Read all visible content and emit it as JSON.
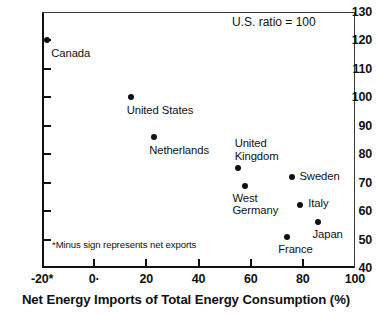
{
  "chart_data": {
    "type": "scatter",
    "title": "",
    "xlabel": "Net Energy Imports of Total Energy Consumption (%)",
    "ylabel": "",
    "xlim": [
      -20,
      100
    ],
    "ylim": [
      40,
      130
    ],
    "grid": false,
    "legend": "none",
    "annotation": "U.S. ratio = 100",
    "footnote": "*Minus sign represents net exports",
    "x_ticks": [
      "-20*",
      "0·",
      "20",
      "40",
      "60",
      "80",
      "100"
    ],
    "x_tick_values": [
      -20,
      0,
      20,
      40,
      60,
      80,
      100
    ],
    "y_ticks": [
      "40",
      "50",
      "60",
      "70",
      "80",
      "90",
      "100",
      "110",
      "120",
      "130"
    ],
    "y_tick_values": [
      40,
      50,
      60,
      70,
      80,
      90,
      100,
      110,
      120,
      130
    ],
    "points": [
      {
        "label": "Canada",
        "x": -18,
        "y": 120,
        "label_lines": [
          "Canada"
        ],
        "label_dx": 4,
        "label_dy": 7,
        "label_align": "left"
      },
      {
        "label": "United States",
        "x": 14,
        "y": 100,
        "label_lines": [
          "United States"
        ],
        "label_dx": -4,
        "label_dy": 7,
        "label_align": "left"
      },
      {
        "label": "Netherlands",
        "x": 23,
        "y": 86,
        "label_lines": [
          "Netherlands"
        ],
        "label_dx": -5,
        "label_dy": 7,
        "label_align": "left"
      },
      {
        "label": "United Kingdom",
        "x": 55,
        "y": 75,
        "label_lines": [
          "United",
          "Kingdom"
        ],
        "label_dx": -3,
        "label_dy": -31,
        "label_align": "left"
      },
      {
        "label": "West Germany",
        "x": 58,
        "y": 69,
        "label_lines": [
          "West",
          "Germany"
        ],
        "label_dx": -13,
        "label_dy": 6,
        "label_align": "left"
      },
      {
        "label": "Sweden",
        "x": 76,
        "y": 72,
        "label_lines": [
          "Sweden"
        ],
        "label_dx": 7,
        "label_dy": -7,
        "label_align": "left"
      },
      {
        "label": "Italy",
        "x": 79,
        "y": 62,
        "label_lines": [
          "Italy"
        ],
        "label_dx": 8,
        "label_dy": -8,
        "label_align": "left"
      },
      {
        "label": "Japan",
        "x": 86,
        "y": 56,
        "label_lines": [
          "Japan"
        ],
        "label_dx": -6,
        "label_dy": 6,
        "label_align": "left"
      },
      {
        "label": "France",
        "x": 74,
        "y": 51,
        "label_lines": [
          "France"
        ],
        "label_dx": -9,
        "label_dy": 6,
        "label_align": "left"
      }
    ]
  }
}
